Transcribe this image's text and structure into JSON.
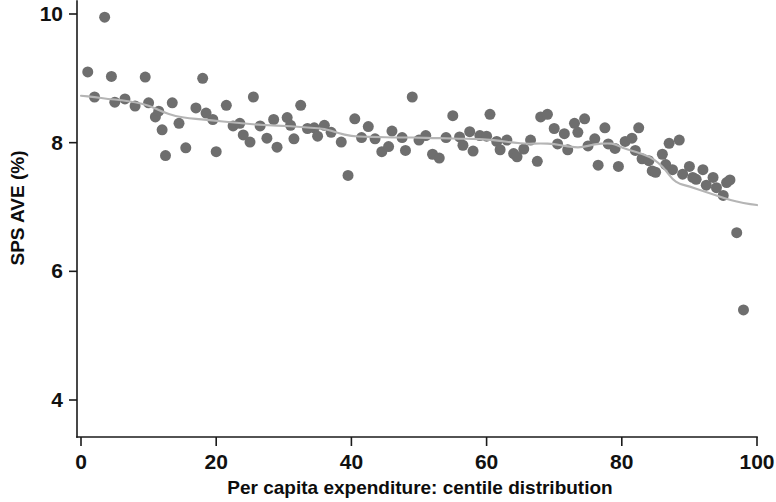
{
  "figure": {
    "background_color": "#ffffff",
    "width": 776,
    "height": 502
  },
  "chart_data": {
    "type": "scatter",
    "title": "",
    "subtitle": "",
    "xlabel": "Per capita expenditure: centile distribution",
    "ylabel": "SPS AVE (%)",
    "xlim": [
      0,
      100
    ],
    "ylim": [
      3.55,
      10.2
    ],
    "xticks": [
      0,
      20,
      40,
      60,
      80,
      100
    ],
    "xtick_labels": [
      "0",
      "20",
      "40",
      "60",
      "80",
      "100"
    ],
    "yticks": [
      4,
      6,
      8,
      10
    ],
    "ytick_labels": [
      "4",
      "6",
      "8",
      "10"
    ],
    "grid": false,
    "legend": null,
    "marker_color": "#6e6e6e",
    "marker_size": 11,
    "trendline_color": "#b5b5b5",
    "trendline_label": "lowess smoother",
    "annotations": [],
    "points": [
      [
        1.0,
        9.1
      ],
      [
        2.0,
        8.71
      ],
      [
        3.5,
        9.95
      ],
      [
        4.5,
        9.03
      ],
      [
        5.0,
        8.63
      ],
      [
        6.5,
        8.68
      ],
      [
        8.0,
        8.57
      ],
      [
        9.5,
        9.02
      ],
      [
        10.0,
        8.62
      ],
      [
        11.0,
        8.4
      ],
      [
        11.5,
        8.49
      ],
      [
        12.0,
        8.2
      ],
      [
        12.5,
        7.8
      ],
      [
        13.5,
        8.62
      ],
      [
        14.5,
        8.3
      ],
      [
        15.5,
        7.92
      ],
      [
        17.0,
        8.54
      ],
      [
        18.0,
        9.0
      ],
      [
        18.5,
        8.46
      ],
      [
        19.5,
        8.36
      ],
      [
        20.0,
        7.86
      ],
      [
        21.5,
        8.58
      ],
      [
        22.5,
        8.26
      ],
      [
        23.5,
        8.3
      ],
      [
        24.0,
        8.12
      ],
      [
        25.0,
        8.01
      ],
      [
        25.5,
        8.71
      ],
      [
        26.5,
        8.26
      ],
      [
        27.5,
        8.07
      ],
      [
        28.5,
        8.36
      ],
      [
        29.0,
        7.93
      ],
      [
        30.5,
        8.39
      ],
      [
        31.0,
        8.27
      ],
      [
        31.5,
        8.06
      ],
      [
        32.5,
        8.58
      ],
      [
        33.5,
        8.22
      ],
      [
        34.5,
        8.23
      ],
      [
        35.0,
        8.1
      ],
      [
        36.0,
        8.27
      ],
      [
        37.0,
        8.16
      ],
      [
        38.5,
        8.01
      ],
      [
        39.5,
        7.49
      ],
      [
        40.5,
        8.37
      ],
      [
        41.5,
        8.08
      ],
      [
        42.5,
        8.25
      ],
      [
        43.5,
        8.06
      ],
      [
        44.5,
        7.86
      ],
      [
        45.5,
        7.94
      ],
      [
        46.0,
        8.18
      ],
      [
        47.5,
        8.08
      ],
      [
        48.0,
        7.88
      ],
      [
        49.0,
        8.71
      ],
      [
        50.0,
        8.04
      ],
      [
        51.0,
        8.11
      ],
      [
        52.0,
        7.82
      ],
      [
        53.0,
        7.76
      ],
      [
        54.0,
        8.08
      ],
      [
        55.0,
        8.42
      ],
      [
        56.0,
        8.09
      ],
      [
        56.5,
        7.96
      ],
      [
        57.5,
        8.17
      ],
      [
        58.0,
        7.87
      ],
      [
        59.0,
        8.11
      ],
      [
        60.0,
        8.1
      ],
      [
        60.5,
        8.44
      ],
      [
        61.5,
        8.02
      ],
      [
        62.0,
        7.89
      ],
      [
        63.0,
        8.04
      ],
      [
        64.0,
        7.83
      ],
      [
        64.5,
        7.78
      ],
      [
        65.5,
        7.9
      ],
      [
        66.5,
        8.04
      ],
      [
        67.5,
        7.71
      ],
      [
        68.0,
        8.4
      ],
      [
        69.0,
        8.44
      ],
      [
        70.0,
        8.22
      ],
      [
        70.5,
        7.98
      ],
      [
        71.5,
        8.14
      ],
      [
        72.0,
        7.89
      ],
      [
        73.0,
        8.3
      ],
      [
        73.5,
        8.16
      ],
      [
        74.5,
        8.37
      ],
      [
        75.0,
        7.95
      ],
      [
        76.0,
        8.06
      ],
      [
        76.5,
        7.65
      ],
      [
        77.5,
        8.23
      ],
      [
        78.0,
        7.98
      ],
      [
        79.0,
        7.91
      ],
      [
        79.5,
        7.63
      ],
      [
        80.5,
        8.02
      ],
      [
        81.5,
        8.07
      ],
      [
        82.0,
        7.88
      ],
      [
        82.5,
        8.23
      ],
      [
        83.0,
        7.75
      ],
      [
        84.0,
        7.72
      ],
      [
        84.5,
        7.56
      ],
      [
        85.0,
        7.54
      ],
      [
        86.0,
        7.82
      ],
      [
        86.5,
        7.66
      ],
      [
        87.0,
        7.99
      ],
      [
        87.5,
        7.58
      ],
      [
        88.5,
        8.04
      ],
      [
        89.0,
        7.51
      ],
      [
        90.0,
        7.63
      ],
      [
        90.5,
        7.46
      ],
      [
        91.0,
        7.43
      ],
      [
        92.0,
        7.58
      ],
      [
        92.5,
        7.34
      ],
      [
        93.5,
        7.46
      ],
      [
        94.0,
        7.3
      ],
      [
        95.0,
        7.18
      ],
      [
        95.5,
        7.38
      ],
      [
        96.0,
        7.42
      ],
      [
        97.0,
        6.6
      ],
      [
        98.0,
        5.4
      ]
    ],
    "trendline": [
      [
        0.0,
        8.73
      ],
      [
        2.0,
        8.71
      ],
      [
        4.0,
        8.68
      ],
      [
        6.0,
        8.66
      ],
      [
        8.0,
        8.63
      ],
      [
        10.0,
        8.58
      ],
      [
        12.0,
        8.48
      ],
      [
        14.0,
        8.41
      ],
      [
        16.0,
        8.38
      ],
      [
        18.0,
        8.36
      ],
      [
        20.0,
        8.34
      ],
      [
        22.0,
        8.32
      ],
      [
        24.0,
        8.3
      ],
      [
        26.0,
        8.28
      ],
      [
        28.0,
        8.27
      ],
      [
        30.0,
        8.26
      ],
      [
        32.0,
        8.25
      ],
      [
        34.0,
        8.23
      ],
      [
        36.0,
        8.22
      ],
      [
        38.0,
        8.15
      ],
      [
        40.0,
        8.1
      ],
      [
        42.0,
        8.09
      ],
      [
        44.0,
        8.09
      ],
      [
        46.0,
        8.08
      ],
      [
        48.0,
        8.08
      ],
      [
        50.0,
        8.08
      ],
      [
        52.0,
        8.07
      ],
      [
        54.0,
        8.07
      ],
      [
        56.0,
        8.06
      ],
      [
        58.0,
        8.06
      ],
      [
        60.0,
        8.05
      ],
      [
        62.0,
        8.03
      ],
      [
        64.0,
        8.0
      ],
      [
        66.0,
        7.98
      ],
      [
        68.0,
        7.99
      ],
      [
        70.0,
        7.98
      ],
      [
        72.0,
        7.94
      ],
      [
        74.0,
        7.92
      ],
      [
        76.0,
        7.98
      ],
      [
        78.0,
        7.99
      ],
      [
        79.0,
        7.98
      ],
      [
        80.0,
        7.92
      ],
      [
        82.0,
        7.86
      ],
      [
        84.0,
        7.79
      ],
      [
        85.5,
        7.68
      ],
      [
        86.5,
        7.57
      ],
      [
        87.5,
        7.43
      ],
      [
        88.5,
        7.36
      ],
      [
        90.0,
        7.32
      ],
      [
        92.0,
        7.25
      ],
      [
        94.0,
        7.18
      ],
      [
        96.0,
        7.11
      ],
      [
        98.0,
        7.06
      ],
      [
        100.0,
        7.03
      ]
    ]
  }
}
